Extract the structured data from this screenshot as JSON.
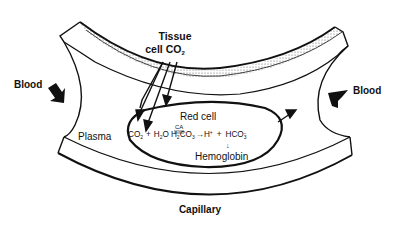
{
  "diagram": {
    "labels": {
      "tissue_line1": "Tissue",
      "tissue_line2": "cell CO",
      "tissue_sub": "2",
      "blood_left": "Blood",
      "blood_right": "Blood",
      "plasma": "Plasma",
      "red_cell": "Red cell",
      "hemoglobin": "Hemoglobin",
      "capillary": "Capillary"
    },
    "equation": {
      "co2": "CO",
      "co2_sub": "2",
      "plus1": "+",
      "h2o_h": "H",
      "h2o_sub": "2",
      "h2o_o": "O",
      "ca": "CA",
      "h2co3_h": "H",
      "h2co3_sub1": "2",
      "h2co3_co": "CO",
      "h2co3_sub2": "3",
      "arrow": "→",
      "hplus": "H",
      "hplus_sup": "+",
      "plus2": "+",
      "hco3": "HCO",
      "hco3_sub": "3",
      "hco3_sup": "−",
      "down_arrow": "↓"
    },
    "colors": {
      "ink": "#111111",
      "background": "#ffffff",
      "stipple": "#777777"
    }
  }
}
